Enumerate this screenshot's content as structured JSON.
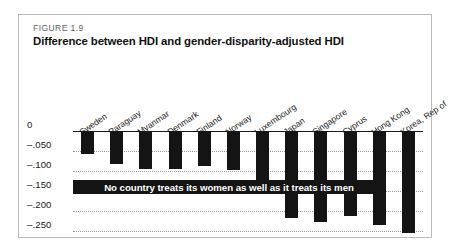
{
  "figure": {
    "number": "FIGURE 1.9",
    "title": "Difference between HDI and gender-disparity-adjusted HDI",
    "banner_text": "No country treats its women as well as it treats its men"
  },
  "chart_data": {
    "type": "bar",
    "title": "Difference between HDI and gender-disparity-adjusted HDI",
    "xlabel": "",
    "ylabel": "",
    "ylim": [
      -0.275,
      0
    ],
    "grid": true,
    "legend": "none",
    "orientation": "vertical",
    "annotation": "No country treats its women as well as it treats its men",
    "ytick_labels": [
      "0",
      "–.050",
      "–.100",
      "–.150",
      "–.200",
      "–.250"
    ],
    "ytick_values": [
      0,
      -0.05,
      -0.1,
      -0.15,
      -0.2,
      -0.25
    ],
    "categories": [
      "Sweden",
      "Paraguay",
      "Myanmar",
      "Denmark",
      "Finland",
      "Norway",
      "Luxembourg",
      "Japan",
      "Singapore",
      "Cyprus",
      "Hong Kong",
      "Korea, Rep of"
    ],
    "values": [
      -0.057,
      -0.082,
      -0.095,
      -0.095,
      -0.088,
      -0.098,
      -0.152,
      -0.218,
      -0.228,
      -0.213,
      -0.235,
      -0.256
    ],
    "bar_color": "#141414"
  }
}
